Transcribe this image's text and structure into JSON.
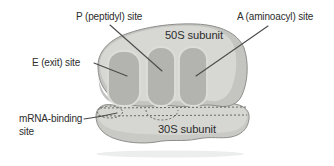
{
  "diagram": {
    "labels": {
      "p_site": "P (peptidyl) site",
      "a_site": "A (aminoacyl) site",
      "e_site": "E (exit) site",
      "large_subunit": "50S subunit",
      "small_subunit": "30S subunit",
      "mrna_binding_line1": "mRNA-binding",
      "mrna_binding_line2": "site"
    },
    "colors": {
      "background": "#ffffff",
      "subunit_shadow": "#c4c5c1",
      "subunit_body": "#d7d8d4",
      "small_subunit_shadow": "#c9cac6",
      "small_subunit_body": "#d6d7d3",
      "corner_shade": "#b9bab6",
      "site_groove": "#b3b4b0",
      "groove_outline": "#dddeda",
      "outline": "#8e8f8b",
      "leader_line": "#4b4b4b",
      "dashed_line": "#4a4a46",
      "text": "#2d2d2d",
      "artifact_band": "#eceded"
    }
  }
}
